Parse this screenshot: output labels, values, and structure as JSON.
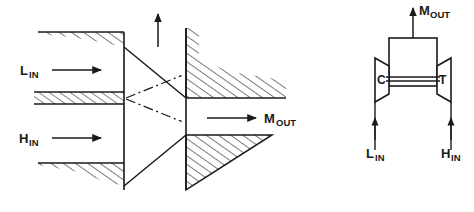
{
  "figure": {
    "background": "#ffffff",
    "line_color": "#1a1a1a",
    "panels": [
      {
        "id": "ejector",
        "name": "ejector-cross-section",
        "labels": {
          "low_pressure_inlet": {
            "base": "L",
            "sub": "IN"
          },
          "high_pressure_inlet": {
            "base": "H",
            "sub": "IN"
          },
          "mixed_outlet": {
            "base": "M",
            "sub": "OUT"
          }
        },
        "arrows": [
          {
            "name": "l-in-arrow",
            "direction": "right"
          },
          {
            "name": "h-in-arrow",
            "direction": "right"
          },
          {
            "name": "m-out-arrow",
            "direction": "right"
          },
          {
            "name": "vertical-arrow",
            "direction": "up",
            "label": ""
          }
        ],
        "walls": [
          "upper-left-hatched-wall",
          "center-hatched-splitter",
          "lower-left-hatched-wall",
          "upper-right-hatched-wall",
          "lower-right-hatched-wedge"
        ],
        "centerlines": [
          "upper-chain-line",
          "lower-chain-line"
        ]
      },
      {
        "id": "turbomachine",
        "name": "turbomachine-schematic",
        "labels": {
          "compressor": "C",
          "turbine": "T",
          "low_pressure_inlet": {
            "base": "L",
            "sub": "IN"
          },
          "high_pressure_inlet": {
            "base": "H",
            "sub": "IN"
          },
          "mixed_outlet": {
            "base": "M",
            "sub": "OUT"
          }
        },
        "arrows": [
          {
            "name": "m-out-arrow",
            "direction": "up"
          },
          {
            "name": "l-in-arrow",
            "direction": "up"
          },
          {
            "name": "h-in-arrow",
            "direction": "up"
          }
        ],
        "components": [
          "mixer-box",
          "compressor-trapezoid",
          "turbine-trapezoid",
          "shaft"
        ]
      }
    ]
  }
}
